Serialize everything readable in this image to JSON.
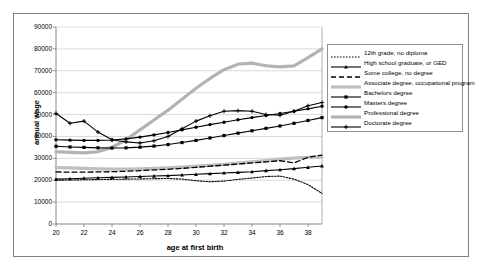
{
  "chart_data": {
    "type": "line",
    "title": "",
    "xlabel": "age at first birth",
    "ylabel": "annual wage",
    "xlim": [
      20,
      39
    ],
    "ylim": [
      0,
      90000
    ],
    "xticks": [
      20,
      22,
      24,
      26,
      28,
      30,
      32,
      34,
      36,
      38
    ],
    "yticks": [
      0,
      10000,
      20000,
      30000,
      40000,
      50000,
      60000,
      70000,
      80000,
      90000
    ],
    "grid": "horizontal",
    "legend_position": "inside-right",
    "x": [
      20,
      21,
      22,
      23,
      24,
      25,
      26,
      27,
      28,
      29,
      30,
      31,
      32,
      33,
      34,
      35,
      36,
      37,
      38,
      39
    ],
    "series": [
      {
        "name": "12th grade, no diploma",
        "style": "dotted",
        "marker": "none",
        "color": "#000000",
        "values": [
          20000,
          20100,
          20200,
          20300,
          20400,
          20500,
          20600,
          20700,
          20800,
          20500,
          19800,
          19300,
          19600,
          20400,
          21000,
          21700,
          21900,
          20500,
          18000,
          14000
        ]
      },
      {
        "name": "High school graduate, or GED",
        "style": "solid",
        "marker": "triangle",
        "color": "#000000",
        "values": [
          20500,
          20700,
          20900,
          21100,
          21300,
          21500,
          21700,
          21900,
          22100,
          22400,
          22700,
          23000,
          23300,
          23600,
          23900,
          24400,
          24800,
          25300,
          25900,
          26500
        ]
      },
      {
        "name": "Some college, no degree",
        "style": "dashed",
        "marker": "none",
        "color": "#000000",
        "values": [
          23800,
          23700,
          23700,
          23800,
          23900,
          24100,
          24400,
          24700,
          25000,
          25400,
          25900,
          26400,
          26900,
          27400,
          27900,
          28400,
          28900,
          27900,
          30500,
          31500
        ]
      },
      {
        "name": "Associate degree, occupational program",
        "style": "solid-thick",
        "marker": "none",
        "color": "#bfbfbf",
        "values": [
          25800,
          25600,
          25400,
          25200,
          25100,
          25100,
          25200,
          25400,
          25700,
          26000,
          26400,
          26800,
          27200,
          27800,
          28400,
          29000,
          29600,
          30100,
          30400,
          30600
        ]
      },
      {
        "name": "Bachelors degree",
        "style": "solid",
        "marker": "square",
        "color": "#000000",
        "values": [
          35500,
          35200,
          35000,
          34800,
          34700,
          34800,
          35100,
          35600,
          36300,
          37200,
          38200,
          39300,
          40400,
          41500,
          42600,
          43700,
          44800,
          46000,
          47300,
          48600
        ]
      },
      {
        "name": "Masters degree",
        "style": "solid",
        "marker": "circle",
        "color": "#000000",
        "values": [
          38500,
          38300,
          38200,
          38200,
          38400,
          38900,
          39700,
          40700,
          41800,
          43000,
          44200,
          45400,
          46500,
          47600,
          48600,
          49600,
          50500,
          51500,
          52600,
          53800
        ]
      },
      {
        "name": "Professional degree",
        "style": "solid-thick",
        "marker": "none",
        "color": "#b3b3b3",
        "values": [
          33000,
          32700,
          32500,
          33000,
          35000,
          38500,
          43000,
          47500,
          52000,
          57000,
          62000,
          66500,
          70500,
          73000,
          73500,
          72300,
          71800,
          72200,
          76000,
          80000
        ]
      },
      {
        "name": "Doctorate degree",
        "style": "solid",
        "marker": "plus",
        "color": "#000000",
        "values": [
          50500,
          46000,
          47000,
          42000,
          38500,
          37500,
          37000,
          38000,
          40000,
          43500,
          47000,
          49500,
          51500,
          51800,
          51500,
          50000,
          49700,
          51500,
          54000,
          55500
        ]
      }
    ]
  },
  "legend": {
    "items": [
      "12th grade, no diploma",
      "High school graduate, or GED",
      "Some college, no degree",
      "Associate degree, occupational program",
      "Bachelors degree",
      "Masters degree",
      "Professional degree",
      "Doctorate degree"
    ]
  }
}
